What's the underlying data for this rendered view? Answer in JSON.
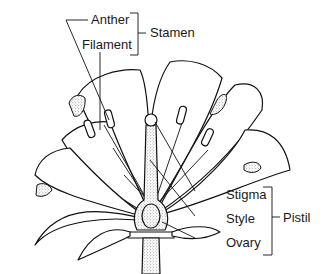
{
  "diagram": {
    "colors": {
      "ink": "#111111",
      "background": "#ffffff",
      "stipple": "#555555"
    },
    "labels": {
      "anther": "Anther",
      "filament": "Filament",
      "stamen": "Stamen",
      "stigma": "Stigma",
      "style": "Style",
      "ovary": "Ovary",
      "pistil": "Pistil"
    },
    "groups": [
      {
        "name": "Stamen",
        "parts": [
          "Anther",
          "Filament"
        ]
      },
      {
        "name": "Pistil",
        "parts": [
          "Stigma",
          "Style",
          "Ovary"
        ]
      }
    ]
  }
}
